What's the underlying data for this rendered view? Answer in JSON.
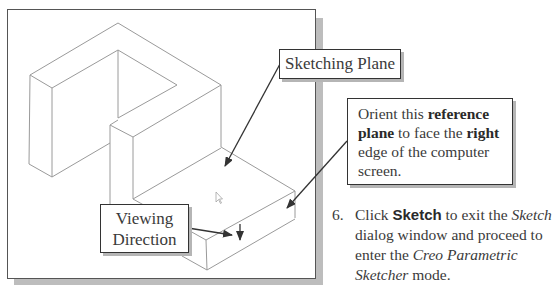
{
  "figure": {
    "callouts": {
      "sketching_plane": "Sketching Plane",
      "viewing_direction": [
        "Viewing",
        "Direction"
      ],
      "orient": {
        "t1": "Orient this ",
        "b1": "reference",
        "b2": "plane",
        "t2": " to face the ",
        "b3": "right",
        "t3": "edge of the computer",
        "t4": "screen."
      }
    },
    "icons": [
      "mouse-cursor-icon",
      "arrow-icon"
    ],
    "colors": {
      "frame_border": "#555555",
      "shadow": "#bdbdbd",
      "line": "#9a9a9a",
      "arrow": "#333333"
    }
  },
  "step": {
    "number": "6.",
    "parts": {
      "p1": "Click ",
      "keyword": "Sketch",
      "p2": " to exit the ",
      "italic1": "Sketch",
      "p3": " dialog window and proceed to enter the ",
      "italic2": "Creo Parametric Sketcher",
      "p4": " mode."
    }
  }
}
